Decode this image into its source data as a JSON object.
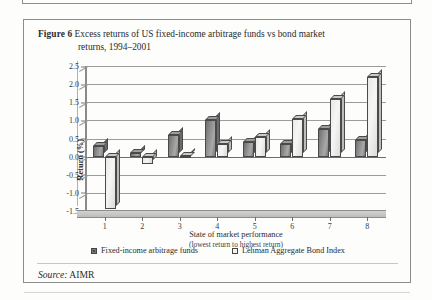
{
  "figure": {
    "label": "Figure 6",
    "caption_line1": "Excess returns of US fixed-income arbitrage funds vs bond market",
    "caption_line2": "returns, 1994–2001",
    "source_label": "Source:",
    "source_value": "AIMR"
  },
  "legend": {
    "series1": "Fixed-income arbitrage funds",
    "series2": "Lehman  Aggregate Bond Index"
  },
  "colors": {
    "series1": "#8d8d8d",
    "series2": "#f3f3f2",
    "frame": "#8b8b8b",
    "grid": "#9c9c9c",
    "text": "#2b2b2b"
  },
  "chart_data": {
    "type": "bar",
    "title": "Excess returns of US fixed-income arbitrage funds vs bond market returns, 1994–2001",
    "xlabel": "State of market performance",
    "xlabel_sub": "(lowest return to highest return)",
    "ylabel": "Return (%)",
    "categories": [
      "1",
      "2",
      "3",
      "4",
      "5",
      "6",
      "7",
      "8"
    ],
    "ylim": [
      -1.5,
      2.5
    ],
    "yticks": [
      2.5,
      2.0,
      1.5,
      1.0,
      0.5,
      0.0,
      -0.5,
      -1.0,
      -1.5
    ],
    "ytick_labels": [
      "2.5",
      "2.0",
      "1.5",
      "1.0",
      "0.5",
      "0.0",
      "-0.5",
      "-1.0",
      "-1.5"
    ],
    "grid": true,
    "legend_position": "bottom",
    "series": [
      {
        "name": "Fixed-income arbitrage funds",
        "values": [
          0.3,
          0.1,
          0.6,
          1.0,
          0.4,
          0.35,
          0.75,
          0.45
        ]
      },
      {
        "name": "Lehman  Aggregate Bond Index",
        "values": [
          -1.45,
          -0.2,
          0.03,
          0.35,
          0.55,
          1.05,
          1.6,
          2.2
        ]
      }
    ]
  }
}
